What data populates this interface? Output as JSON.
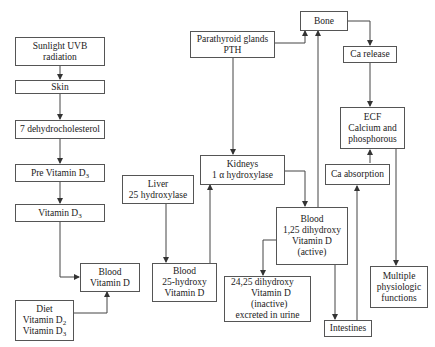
{
  "diagram": {
    "nodes": {
      "sunlight": {
        "lines": [
          "Sunlight UVB",
          "radiation"
        ]
      },
      "skin": {
        "lines": [
          "Skin"
        ]
      },
      "dehydro": {
        "lines": [
          "7 dehydrocholesterol"
        ]
      },
      "previtd3": {
        "lines": [
          "Pre Vitamin D",
          "3"
        ]
      },
      "vitd3": {
        "lines": [
          "Vitamin D",
          "3"
        ]
      },
      "blood_vitd": {
        "lines": [
          "Blood",
          "Vitamin D"
        ]
      },
      "diet": {
        "lines": [
          "Diet",
          "Vitamin D",
          "2",
          "Vitamin D",
          "3"
        ]
      },
      "liver": {
        "lines": [
          "Liver",
          "25 hydroxylase"
        ]
      },
      "blood_25": {
        "lines": [
          "Blood",
          "25-hydroxy",
          "Vitamin D"
        ]
      },
      "parathyroid": {
        "lines": [
          "Parathyroid glands",
          "PTH"
        ]
      },
      "kidneys": {
        "lines": [
          "Kidneys",
          "1 α hydroxylase"
        ]
      },
      "blood_125": {
        "lines": [
          "Blood",
          "1,25 dihydroxy",
          "Vitamin D",
          "(active)"
        ]
      },
      "inactive_2425": {
        "lines": [
          "24,25 dihydroxy",
          "Vitamin D",
          "(inactive)",
          "excreted in urine",
          "↓"
        ]
      },
      "bone": {
        "lines": [
          "Bone"
        ]
      },
      "ca_release": {
        "lines": [
          "Ca release"
        ]
      },
      "ecf": {
        "lines": [
          "ECF",
          "Calcium and",
          "phosphorous"
        ]
      },
      "ca_absorption": {
        "lines": [
          "Ca absorption"
        ]
      },
      "intestines": {
        "lines": [
          "Intestines"
        ]
      },
      "multiple": {
        "lines": [
          "Multiple",
          "physiologic",
          "functions"
        ]
      }
    },
    "edges": [
      {
        "from": "Sunlight UVB radiation",
        "to": "Skin"
      },
      {
        "from": "Skin",
        "to": "7 dehydrocholesterol"
      },
      {
        "from": "7 dehydrocholesterol",
        "to": "Pre Vitamin D3"
      },
      {
        "from": "Pre Vitamin D3",
        "to": "Vitamin D3"
      },
      {
        "from": "Vitamin D3",
        "to": "Blood Vitamin D"
      },
      {
        "from": "Diet Vitamin D2 Vitamin D3",
        "to": "Blood Vitamin D"
      },
      {
        "from": "Liver 25 hydroxylase",
        "to": "Blood 25-hydroxy Vitamin D"
      },
      {
        "from": "Blood 25-hydroxy Vitamin D",
        "to": "Kidneys 1 α hydroxylase"
      },
      {
        "from": "Parathyroid glands PTH",
        "to": "Kidneys 1 α hydroxylase"
      },
      {
        "from": "Parathyroid glands PTH",
        "to": "Bone"
      },
      {
        "from": "Kidneys 1 α hydroxylase",
        "to": "Blood 1,25 dihydroxy Vitamin D (active)"
      },
      {
        "from": "Blood 1,25 dihydroxy Vitamin D (active)",
        "to": "24,25 dihydroxy Vitamin D (inactive)"
      },
      {
        "from": "Blood 1,25 dihydroxy Vitamin D (active)",
        "to": "Bone"
      },
      {
        "from": "Blood 1,25 dihydroxy Vitamin D (active)",
        "to": "Intestines"
      },
      {
        "from": "Intestines",
        "to": "Ca absorption"
      },
      {
        "from": "Ca absorption",
        "to": "ECF Calcium and phosphorous"
      },
      {
        "from": "Bone",
        "to": "Ca release"
      },
      {
        "from": "Ca release",
        "to": "ECF Calcium and phosphorous"
      },
      {
        "from": "ECF Calcium and phosphorous",
        "to": "Multiple physiologic functions"
      }
    ]
  }
}
